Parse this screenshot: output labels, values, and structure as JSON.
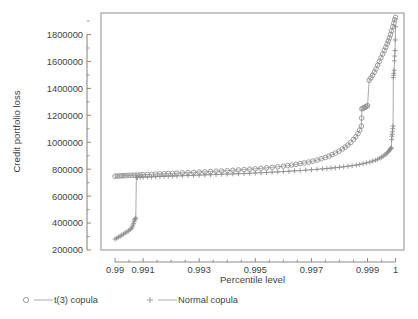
{
  "chart_data": {
    "type": "line",
    "title": "",
    "xlabel": "Percentile level",
    "ylabel": "Credit portfolio loss",
    "xlim": [
      0.9895,
      1.0003
    ],
    "ylim": [
      200000,
      1960000
    ],
    "grid": false,
    "legend_position": "bottom-left",
    "xticks": [
      0.99,
      0.991,
      0.993,
      0.995,
      0.997,
      0.999,
      1
    ],
    "xticklabels": [
      "0.99",
      "0.991",
      "0.993",
      "0.995",
      "0.997",
      "0.999",
      "1"
    ],
    "xticks_minor": [
      0.9905,
      0.9915,
      0.992,
      0.9925,
      0.9935,
      0.994,
      0.9945,
      0.9955,
      0.996,
      0.9965,
      0.9975,
      0.998,
      0.9985,
      0.9995
    ],
    "yticks": [
      200000,
      400000,
      600000,
      800000,
      1000000,
      1200000,
      1400000,
      1600000,
      1800000
    ],
    "yticklabels": [
      "200000",
      "400000",
      "600000",
      "800000",
      "1000000",
      "1200000",
      "1400000",
      "1600000",
      "1800000"
    ],
    "yticks_minor": [
      300000,
      500000,
      700000,
      900000,
      1100000,
      1300000,
      1500000,
      1700000,
      1900000
    ],
    "series": [
      {
        "name": "t(3) copula",
        "marker": "circle",
        "color": "#8d8d8d",
        "x": [
          0.99,
          0.99008,
          0.99016,
          0.99024,
          0.99032,
          0.9904,
          0.9905,
          0.9906,
          0.9907,
          0.9908,
          0.9909,
          0.991,
          0.99115,
          0.9913,
          0.99145,
          0.9916,
          0.99175,
          0.9919,
          0.99205,
          0.9922,
          0.9924,
          0.9926,
          0.9928,
          0.993,
          0.9932,
          0.9934,
          0.9936,
          0.9938,
          0.994,
          0.9942,
          0.9944,
          0.9946,
          0.9948,
          0.995,
          0.9952,
          0.9954,
          0.9956,
          0.9958,
          0.996,
          0.99615,
          0.9963,
          0.99645,
          0.9966,
          0.99675,
          0.9969,
          0.99705,
          0.9972,
          0.99735,
          0.9975,
          0.99762,
          0.99774,
          0.99786,
          0.99798,
          0.9981,
          0.9982,
          0.9983,
          0.9984,
          0.9985,
          0.99858,
          0.99866,
          0.99872,
          0.99878,
          0.99879,
          0.9988,
          0.99884,
          0.99888,
          0.99892,
          0.99896,
          0.999,
          0.99906,
          0.99912,
          0.99918,
          0.99924,
          0.9993,
          0.99936,
          0.99942,
          0.99948,
          0.99954,
          0.9996,
          0.99965,
          0.9997,
          0.99974,
          0.99978,
          0.99982,
          0.99986,
          0.9999,
          0.99994,
          0.99997,
          1.0
        ],
        "y": [
          748000,
          749000,
          750000,
          751000,
          752000,
          753000,
          754000,
          755000,
          756000,
          757000,
          758000,
          759000,
          760500,
          762000,
          763500,
          765000,
          766500,
          768000,
          769500,
          771000,
          773000,
          775000,
          777000,
          779000,
          781000,
          783000,
          785000,
          787000,
          789500,
          792000,
          794500,
          797000,
          800000,
          803000,
          806500,
          810000,
          814000,
          818000,
          823000,
          827000,
          831000,
          836000,
          841000,
          847000,
          853000,
          860000,
          868000,
          877000,
          887000,
          897000,
          908000,
          920000,
          934000,
          950000,
          964000,
          980000,
          998000,
          1020000,
          1040000,
          1065000,
          1090000,
          1120000,
          1180000,
          1248000,
          1252000,
          1258000,
          1262000,
          1266000,
          1272000,
          1460000,
          1478000,
          1498000,
          1520000,
          1545000,
          1572000,
          1600000,
          1628000,
          1655000,
          1682000,
          1705000,
          1730000,
          1752000,
          1775000,
          1800000,
          1828000,
          1858000,
          1886000,
          1910000,
          1928000
        ]
      },
      {
        "name": "Normal copula",
        "marker": "plus",
        "color": "#8d8d8d",
        "x": [
          0.99,
          0.99006,
          0.99012,
          0.99018,
          0.99024,
          0.9903,
          0.99036,
          0.99042,
          0.99048,
          0.99054,
          0.99058,
          0.99062,
          0.99064,
          0.99066,
          0.99068,
          0.9907,
          0.99072,
          0.99074,
          0.99076,
          0.9908,
          0.9909,
          0.991,
          0.99115,
          0.9913,
          0.99145,
          0.9916,
          0.99175,
          0.9919,
          0.99205,
          0.9922,
          0.9924,
          0.9926,
          0.9928,
          0.993,
          0.9932,
          0.9934,
          0.9936,
          0.9938,
          0.994,
          0.9942,
          0.9944,
          0.9946,
          0.9948,
          0.995,
          0.9952,
          0.9954,
          0.9956,
          0.9958,
          0.996,
          0.9962,
          0.9964,
          0.9966,
          0.9968,
          0.997,
          0.9972,
          0.9974,
          0.99755,
          0.9977,
          0.99785,
          0.998,
          0.99815,
          0.9983,
          0.99845,
          0.9986,
          0.99872,
          0.99884,
          0.99896,
          0.99908,
          0.99918,
          0.99928,
          0.99936,
          0.99944,
          0.9995,
          0.99956,
          0.99962,
          0.99967,
          0.99971,
          0.99975,
          0.99978,
          0.99981,
          0.99983,
          0.99985,
          0.99986,
          0.99987,
          0.99988,
          0.99989,
          0.9999,
          0.99991,
          0.99992,
          0.99993,
          0.99994,
          0.99995,
          0.99996,
          0.99997,
          0.99998,
          0.99999,
          1.0
        ],
        "y": [
          281000,
          288000,
          295000,
          302000,
          310000,
          318000,
          326000,
          334000,
          342000,
          352000,
          360000,
          372000,
          385000,
          398000,
          412000,
          425000,
          432000,
          438000,
          738000,
          739000,
          740000,
          741000,
          742000,
          743000,
          744500,
          746000,
          747000,
          748000,
          749000,
          750000,
          751500,
          753000,
          754500,
          756000,
          757500,
          759000,
          760500,
          762000,
          763500,
          765000,
          766500,
          768000,
          770000,
          772000,
          774000,
          776000,
          778000,
          780000,
          782500,
          785000,
          787500,
          790000,
          793000,
          796000,
          799000,
          802500,
          805000,
          808000,
          811000,
          814500,
          818000,
          822000,
          826000,
          831000,
          836000,
          841000,
          847000,
          853000,
          860000,
          867000,
          874000,
          882000,
          889000,
          897000,
          906000,
          915000,
          923000,
          932000,
          940000,
          948000,
          954000,
          960000,
          1020000,
          1045000,
          1060000,
          1078000,
          1100000,
          1120000,
          1480000,
          1498000,
          1512000,
          1535000,
          1605000,
          1640000,
          1680000,
          1760000,
          1858000
        ]
      }
    ]
  },
  "legend": {
    "items": [
      {
        "label": "t(3) copula",
        "marker": "circle"
      },
      {
        "label": "Normal copula",
        "marker": "plus"
      }
    ]
  }
}
